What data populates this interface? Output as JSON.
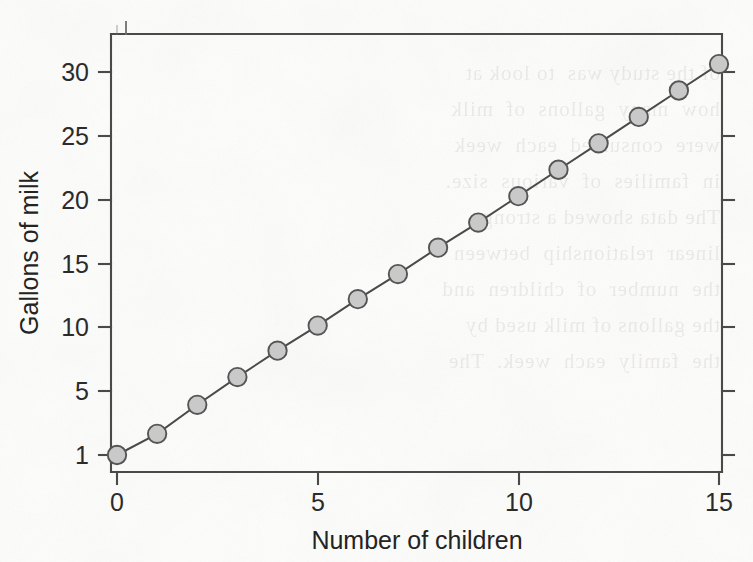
{
  "chart_data": {
    "type": "line",
    "title": "",
    "subtitle": "",
    "xlabel": "Number of children",
    "ylabel": "Gallons of milk",
    "x": [
      0,
      1,
      2,
      3,
      4,
      5,
      6,
      7,
      8,
      9,
      10,
      11,
      12,
      13,
      14,
      15
    ],
    "values": [
      1.0,
      2.6,
      4.8,
      6.9,
      8.9,
      10.8,
      12.8,
      14.7,
      16.7,
      18.6,
      20.6,
      22.6,
      24.6,
      26.6,
      28.6,
      30.6
    ],
    "series": [
      {
        "name": "Gallons of milk",
        "values": [
          1.0,
          2.6,
          4.8,
          6.9,
          8.9,
          10.8,
          12.8,
          14.7,
          16.7,
          18.6,
          20.6,
          22.6,
          24.6,
          26.6,
          28.6,
          30.6
        ]
      }
    ],
    "xlim": [
      0,
      15
    ],
    "ylim": [
      1,
      31.9
    ],
    "xticks": [
      0,
      5,
      10,
      15
    ],
    "xtick_labels": [
      "0",
      "5",
      "10",
      "15"
    ],
    "yticks": [
      1,
      5,
      10,
      15,
      20,
      25,
      30
    ],
    "ytick_labels": [
      "1",
      "5",
      "10",
      "15",
      "20",
      "25",
      "30"
    ],
    "grid": false,
    "legend": false,
    "legend_position": "none",
    "marker": "filled-circle",
    "marker_face_color": "#c9c9c9",
    "marker_edge_color": "#555555",
    "line_color": "#4a4a4a",
    "frame": "box",
    "tick_direction": "out-left-bottom-in-right-top"
  },
  "figure": {
    "background_color": "#fdfdfc",
    "axes_color": "#4a4a4a",
    "text_color": "#2b2b2b",
    "ghost_text": "of the study was  to look at\nhow  many  gallons  of  milk\nwere  consumed  each  week\nin  families  of  various  size.\nThe data showed a strong\nlinear  relationship  between\nthe  number  of  children  and\nthe gallons of milk used by\nthe  family  each  week.  The\nslope  of  the  regression\nline  was  about  2  gallons"
  }
}
